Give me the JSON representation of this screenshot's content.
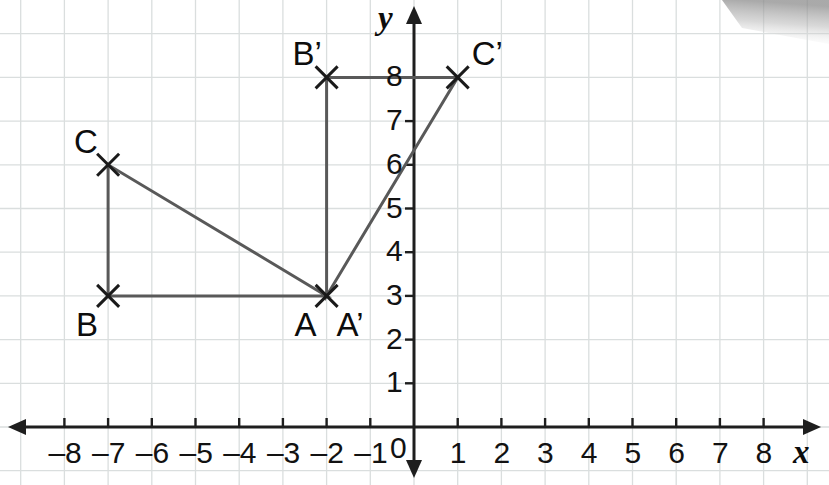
{
  "figure": {
    "type": "coordinate-plane-geometry",
    "axes": {
      "x_label": "x",
      "y_label": "y",
      "origin_label": "0",
      "x_ticks": [
        "–8",
        "–7",
        "–6",
        "–5",
        "–4",
        "–3",
        "–2",
        "–1",
        "1",
        "2",
        "3",
        "4",
        "5",
        "6",
        "7",
        "8"
      ],
      "x_tick_values": [
        -8,
        -7,
        -6,
        -5,
        -4,
        -3,
        -2,
        -1,
        1,
        2,
        3,
        4,
        5,
        6,
        7,
        8
      ],
      "y_ticks": [
        "1",
        "2",
        "3",
        "4",
        "5",
        "6",
        "7",
        "8"
      ],
      "y_tick_values": [
        1,
        2,
        3,
        4,
        5,
        6,
        7,
        8
      ],
      "x_range": [
        -8.8,
        8.8
      ],
      "y_range": [
        -0.6,
        9.2
      ],
      "grid": true,
      "grid_color": "#dadede",
      "axis_color": "#1e1e1e",
      "arrowheads": [
        "x-left",
        "x-right",
        "y-up",
        "y-down"
      ]
    },
    "points": [
      {
        "name": "A",
        "label": "A",
        "x": -2,
        "y": 3,
        "label_pos": "below-left"
      },
      {
        "name": "B",
        "label": "B",
        "x": -7,
        "y": 3,
        "label_pos": "below-left"
      },
      {
        "name": "C",
        "label": "C",
        "x": -7,
        "y": 6,
        "label_pos": "above-left"
      },
      {
        "name": "A'",
        "label": "A’",
        "x": -2,
        "y": 3,
        "label_pos": "below-right"
      },
      {
        "name": "B'",
        "label": "B’",
        "x": -2,
        "y": 8,
        "label_pos": "above-left"
      },
      {
        "name": "C'",
        "label": "C’",
        "x": 1,
        "y": 8,
        "label_pos": "above-right"
      }
    ],
    "shapes": [
      {
        "name": "triangle-ABC",
        "vertices": [
          "B",
          "C",
          "A"
        ],
        "closed": true
      },
      {
        "name": "triangle-A1B1C1",
        "vertices": [
          "A'",
          "B'",
          "C'"
        ],
        "closed": true
      }
    ],
    "style": {
      "edge_color": "#595959",
      "edge_width": 3,
      "marker": "x-cross",
      "marker_color": "#1a1a1a",
      "marker_size": 22,
      "marker_width": 3
    }
  }
}
